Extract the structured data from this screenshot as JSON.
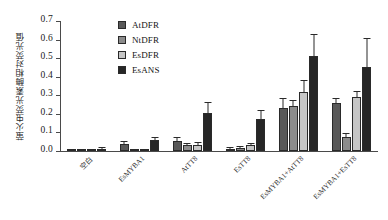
{
  "chart_data": {
    "type": "bar",
    "title": "",
    "xlabel": "",
    "ylabel": "萤火虫荧光素酶相对荧光值",
    "ylim": [
      0.0,
      0.7
    ],
    "ytick_labels": [
      "0.0",
      "0.1",
      "0.2",
      "0.3",
      "0.4",
      "0.5",
      "0.6",
      "0.7"
    ],
    "ytick_values": [
      0.0,
      0.1,
      0.2,
      0.3,
      0.4,
      0.5,
      0.6,
      0.7
    ],
    "grid": false,
    "legend_position": "top-center",
    "error_bars": true,
    "categories": [
      "空白",
      "EsMYBA1",
      "AtTT8",
      "EsTT8",
      "EsMYBA1+AtTT8",
      "EsMYBA1+EsTT8"
    ],
    "series": [
      {
        "name": "AtDFR",
        "color": "#595959",
        "values": [
          0.004,
          0.037,
          0.055,
          0.01,
          0.232,
          0.257
        ],
        "errors": [
          0.003,
          0.013,
          0.014,
          0.006,
          0.048,
          0.022
        ]
      },
      {
        "name": "NtDFR",
        "color": "#8c8c8c",
        "values": [
          0.004,
          0.009,
          0.03,
          0.017,
          0.245,
          0.073
        ],
        "errors": [
          0.002,
          0.004,
          0.007,
          0.005,
          0.022,
          0.016
        ]
      },
      {
        "name": "EsDFR",
        "color": "#c6c6c6",
        "values": [
          0.004,
          0.01,
          0.035,
          0.03,
          0.32,
          0.29
        ],
        "errors": [
          0.002,
          0.004,
          0.008,
          0.008,
          0.058,
          0.026
        ]
      },
      {
        "name": "EsANS",
        "color": "#262626",
        "values": [
          0.012,
          0.057,
          0.203,
          0.172,
          0.512,
          0.452
        ],
        "errors": [
          0.006,
          0.013,
          0.056,
          0.042,
          0.112,
          0.152
        ]
      }
    ]
  }
}
